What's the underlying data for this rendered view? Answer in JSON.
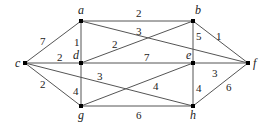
{
  "graph": {
    "nodes": [
      {
        "id": "a",
        "x": 81,
        "y": 21,
        "lx": 78,
        "ly": 14
      },
      {
        "id": "b",
        "x": 193,
        "y": 21,
        "lx": 195,
        "ly": 14
      },
      {
        "id": "c",
        "x": 25,
        "y": 63,
        "lx": 15,
        "ly": 67
      },
      {
        "id": "d",
        "x": 81,
        "y": 63,
        "lx": 73,
        "ly": 59
      },
      {
        "id": "e",
        "x": 193,
        "y": 63,
        "lx": 186,
        "ly": 59
      },
      {
        "id": "f",
        "x": 248,
        "y": 63,
        "lx": 253,
        "ly": 67
      },
      {
        "id": "g",
        "x": 81,
        "y": 106,
        "lx": 78,
        "ly": 119
      },
      {
        "id": "h",
        "x": 193,
        "y": 106,
        "lx": 190,
        "ly": 119
      }
    ],
    "edges": [
      {
        "from": "c",
        "to": "a",
        "weight": "7",
        "lx": 40,
        "ly": 45
      },
      {
        "from": "c",
        "to": "d",
        "weight": "2",
        "lx": 57,
        "ly": 61
      },
      {
        "from": "c",
        "to": "g",
        "weight": "2",
        "lx": 40,
        "ly": 88
      },
      {
        "from": "a",
        "to": "d",
        "weight": "1",
        "lx": 74,
        "ly": 46
      },
      {
        "from": "a",
        "to": "b",
        "weight": "2",
        "lx": 136,
        "ly": 17
      },
      {
        "from": "a",
        "to": "f",
        "weight": "3",
        "lx": 136,
        "ly": 35
      },
      {
        "from": "d",
        "to": "b",
        "weight": "2",
        "lx": 112,
        "ly": 48
      },
      {
        "from": "d",
        "to": "e",
        "weight": "7",
        "lx": 144,
        "ly": 61
      },
      {
        "from": "d",
        "to": "g",
        "weight": "4",
        "lx": 73,
        "ly": 95
      },
      {
        "from": "b",
        "to": "e",
        "weight": "5",
        "lx": 196,
        "ly": 40
      },
      {
        "from": "b",
        "to": "f",
        "weight": "1",
        "lx": 216,
        "ly": 40
      },
      {
        "from": "e",
        "to": "f",
        "weight": "3",
        "lx": 212,
        "ly": 77
      },
      {
        "from": "e",
        "to": "h",
        "weight": "4",
        "lx": 196,
        "ly": 92
      },
      {
        "from": "g",
        "to": "e",
        "weight": "4",
        "lx": 153,
        "ly": 90
      },
      {
        "from": "c",
        "to": "h",
        "weight": "3",
        "lx": 97,
        "ly": 80
      },
      {
        "from": "g",
        "to": "h",
        "weight": "6",
        "lx": 136,
        "ly": 119
      },
      {
        "from": "h",
        "to": "f",
        "weight": "6",
        "lx": 226,
        "ly": 91
      }
    ]
  }
}
